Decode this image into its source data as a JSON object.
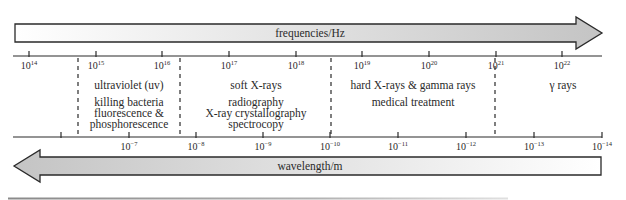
{
  "frequency_arrow": {
    "label": "frequencies/Hz",
    "direction": "right",
    "gradient": [
      "#ffffff",
      "#c4c4c4"
    ]
  },
  "wavelength_arrow": {
    "label": "wavelength/m",
    "direction": "left",
    "gradient": [
      "#c4c4c4",
      "#ffffff"
    ]
  },
  "frequency_axis": {
    "ticks": [
      {
        "x": 29,
        "base": "10",
        "exp": "14"
      },
      {
        "x": 96,
        "base": "10",
        "exp": "15"
      },
      {
        "x": 162,
        "base": "10",
        "exp": "16"
      },
      {
        "x": 229,
        "base": "10",
        "exp": "17"
      },
      {
        "x": 296,
        "base": "10",
        "exp": "18"
      },
      {
        "x": 362,
        "base": "10",
        "exp": "19"
      },
      {
        "x": 429,
        "base": "10",
        "exp": "20"
      },
      {
        "x": 496,
        "base": "10",
        "exp": "21"
      },
      {
        "x": 562,
        "base": "10",
        "exp": "22"
      }
    ]
  },
  "wavelength_axis": {
    "ticks": [
      {
        "x": 61,
        "base": "",
        "exp": ""
      },
      {
        "x": 129,
        "base": "10",
        "exp": "−7"
      },
      {
        "x": 196,
        "base": "10",
        "exp": "−8"
      },
      {
        "x": 263,
        "base": "10",
        "exp": "−9"
      },
      {
        "x": 330,
        "base": "10",
        "exp": "−10"
      },
      {
        "x": 398,
        "base": "10",
        "exp": "−11"
      },
      {
        "x": 466,
        "base": "10",
        "exp": "−12"
      },
      {
        "x": 534,
        "base": "10",
        "exp": "−13"
      },
      {
        "x": 602,
        "base": "10",
        "exp": "−14"
      }
    ]
  },
  "dividers": [
    78,
    180,
    331,
    495
  ],
  "regions": [
    {
      "name": "ultraviolet",
      "cx": 129,
      "title": "ultraviolet (uv)",
      "uses": [
        "killing bacteria",
        "fluorescence &",
        "phosphorescence"
      ]
    },
    {
      "name": "soft-x-rays",
      "cx": 256,
      "title": "soft X-rays",
      "uses": [
        "radiography",
        "X-ray crystallography",
        "spectrocopy"
      ]
    },
    {
      "name": "hard-x-rays-gamma",
      "cx": 413,
      "title": "hard X-rays & gamma rays",
      "uses": [
        "medical treatment"
      ]
    },
    {
      "name": "gamma-rays",
      "cx": 563,
      "title": "γ rays",
      "uses": []
    }
  ],
  "chart_data": {
    "type": "table",
    "frequency_axis_label": "frequencies/Hz",
    "wavelength_axis_label": "wavelength/m",
    "frequency_ticks_hz": [
      "10^14",
      "10^15",
      "10^16",
      "10^17",
      "10^18",
      "10^19",
      "10^20",
      "10^21",
      "10^22"
    ],
    "wavelength_ticks_m": [
      "10^-7",
      "10^-8",
      "10^-9",
      "10^-10",
      "10^-11",
      "10^-12",
      "10^-13",
      "10^-14"
    ],
    "regions": [
      {
        "name": "ultraviolet (uv)",
        "uses": [
          "killing bacteria",
          "fluorescence & phosphorescence"
        ]
      },
      {
        "name": "soft X-rays",
        "uses": [
          "radiography",
          "X-ray crystallography",
          "spectrocopy"
        ]
      },
      {
        "name": "hard X-rays & gamma rays",
        "uses": [
          "medical treatment"
        ]
      },
      {
        "name": "γ rays",
        "uses": []
      }
    ]
  }
}
